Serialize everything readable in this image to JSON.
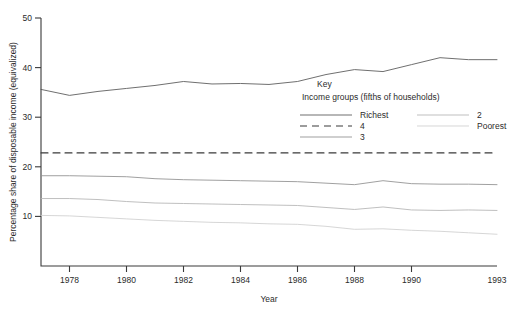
{
  "chart_data": {
    "type": "line",
    "title": "",
    "xlabel": "Year",
    "ylabel": "Percentage share of disposable income (equivalized)",
    "xlim": [
      1977,
      1993
    ],
    "ylim": [
      0,
      50
    ],
    "yticks": [
      10,
      20,
      30,
      40,
      50
    ],
    "ytick_labels": [
      "10",
      "20",
      "30",
      "40",
      "50"
    ],
    "xticks": [
      1978,
      1980,
      1982,
      1984,
      1986,
      1988,
      1990,
      1993
    ],
    "xtick_labels": [
      "1978",
      "1980",
      "1982",
      "1984",
      "1986",
      "1988",
      "1990",
      "1993"
    ],
    "grid": false,
    "legend_position": "inside-center-right",
    "x": [
      1977,
      1978,
      1979,
      1980,
      1981,
      1982,
      1983,
      1984,
      1985,
      1986,
      1987,
      1988,
      1989,
      1990,
      1991,
      1992,
      1993
    ],
    "series": [
      {
        "name": "Richest",
        "style": "solid",
        "color": "#555555",
        "values": [
          35.6,
          34.4,
          35.2,
          35.8,
          36.4,
          37.2,
          36.7,
          36.8,
          36.6,
          37.2,
          38.6,
          39.6,
          39.2,
          40.6,
          42.0,
          41.6,
          41.6
        ]
      },
      {
        "name": "4",
        "style": "dashed",
        "color": "#3a3a3a",
        "values": [
          22.8,
          22.8,
          22.8,
          22.8,
          22.8,
          22.8,
          22.8,
          22.8,
          22.8,
          22.8,
          22.8,
          22.8,
          22.8,
          22.8,
          22.8,
          22.8,
          22.8
        ]
      },
      {
        "name": "3",
        "style": "solid",
        "color": "#8f8f8f",
        "values": [
          18.2,
          18.2,
          18.1,
          18.0,
          17.6,
          17.4,
          17.3,
          17.2,
          17.1,
          17.0,
          16.7,
          16.4,
          17.2,
          16.6,
          16.5,
          16.5,
          16.4
        ]
      },
      {
        "name": "2",
        "style": "solid",
        "color": "#b4b4b4",
        "values": [
          13.6,
          13.6,
          13.4,
          13.0,
          12.7,
          12.6,
          12.5,
          12.4,
          12.3,
          12.2,
          11.8,
          11.4,
          11.9,
          11.3,
          11.2,
          11.3,
          11.2
        ]
      },
      {
        "name": "Poorest",
        "style": "solid",
        "color": "#cfcfcf",
        "values": [
          10.2,
          10.1,
          9.8,
          9.5,
          9.2,
          9.0,
          8.8,
          8.7,
          8.5,
          8.4,
          8.0,
          7.4,
          7.5,
          7.2,
          7.0,
          6.7,
          6.4
        ]
      }
    ]
  },
  "legend": {
    "title": "Key",
    "subtitle": "Income groups (fifths of households)",
    "column1": [
      {
        "label": "Richest",
        "style": "solid",
        "color": "#555555"
      },
      {
        "label": "4",
        "style": "dashed",
        "color": "#3a3a3a"
      },
      {
        "label": "3",
        "style": "solid",
        "color": "#8f8f8f"
      }
    ],
    "column2": [
      {
        "label": "2",
        "style": "solid",
        "color": "#b4b4b4"
      },
      {
        "label": "Poorest",
        "style": "solid",
        "color": "#cfcfcf"
      }
    ]
  }
}
